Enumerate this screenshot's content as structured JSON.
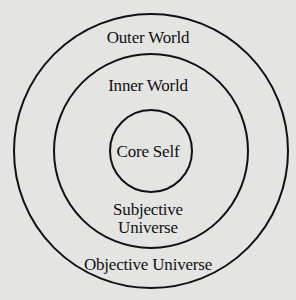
{
  "diagram": {
    "type": "concentric-circles",
    "background_color": "#e4e4e2",
    "stroke_color": "#111111",
    "circles": [
      {
        "name": "outer",
        "cx": 151,
        "cy": 151,
        "r": 137
      },
      {
        "name": "middle",
        "cx": 151,
        "cy": 151,
        "r": 97
      },
      {
        "name": "inner",
        "cx": 151,
        "cy": 151,
        "r": 41
      }
    ],
    "labels": {
      "outer_world": "Outer World",
      "inner_world": "Inner World",
      "core_self": "Core Self",
      "subjective_line1": "Subjective",
      "subjective_line2": "Universe",
      "objective_universe": "Objective Universe"
    }
  }
}
